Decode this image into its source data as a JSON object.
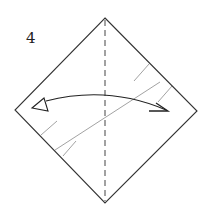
{
  "step": {
    "number": "4"
  },
  "diagram": {
    "elements": [
      {
        "name": "paper-outline",
        "kind": "square rotated 45 degrees"
      },
      {
        "name": "center-fold-line",
        "kind": "dashed vertical valley fold"
      },
      {
        "name": "diagonal-crease-line",
        "kind": "thin existing crease"
      },
      {
        "name": "shading-hatches",
        "kind": "colored-side hatch marks"
      },
      {
        "name": "fold-and-unfold-arrow",
        "kind": "curved double-headed arrow"
      }
    ],
    "colors": {
      "outline": "#333333",
      "crease": "#8a8a8a",
      "arrow": "#222222",
      "background": "#ffffff"
    }
  }
}
